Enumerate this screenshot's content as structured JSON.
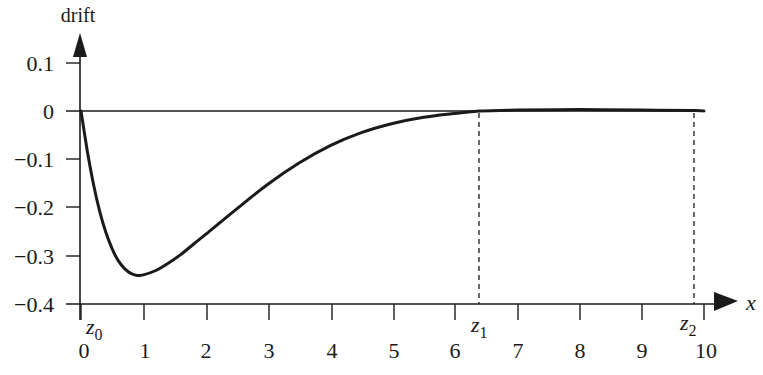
{
  "chart_data": {
    "type": "line",
    "title": "",
    "xlabel": "x",
    "ylabel": "drift",
    "xlim": [
      0,
      10
    ],
    "ylim": [
      -0.4,
      0.1
    ],
    "grid": false,
    "legend": null,
    "x_ticks": [
      0,
      1,
      2,
      3,
      4,
      5,
      6,
      7,
      8,
      9,
      10
    ],
    "x_tick_labels": [
      "0",
      "1",
      "2",
      "3",
      "4",
      "5",
      "6",
      "7",
      "8",
      "9",
      "10"
    ],
    "y_ticks": [
      0.1,
      0,
      -0.1,
      -0.2,
      -0.3,
      -0.4
    ],
    "y_tick_labels": [
      "0.1",
      "0",
      "−0.1",
      "−0.2",
      "−0.3",
      "−0.4"
    ],
    "series": [
      {
        "name": "drift",
        "x": [
          0,
          0.1,
          0.2,
          0.3,
          0.4,
          0.5,
          0.6,
          0.7,
          0.8,
          0.9,
          1.0,
          1.2,
          1.4,
          1.6,
          1.8,
          2.0,
          2.5,
          3.0,
          3.5,
          4.0,
          4.5,
          5.0,
          5.5,
          6.0,
          6.4,
          7.0,
          8.0,
          9.0,
          9.85,
          10.0
        ],
        "values": [
          0,
          -0.082,
          -0.152,
          -0.208,
          -0.252,
          -0.286,
          -0.311,
          -0.327,
          -0.337,
          -0.341,
          -0.34,
          -0.331,
          -0.316,
          -0.298,
          -0.277,
          -0.256,
          -0.203,
          -0.152,
          -0.108,
          -0.072,
          -0.045,
          -0.026,
          -0.013,
          -0.005,
          0.0,
          0.002,
          0.003,
          0.002,
          0.001,
          0.0
        ]
      }
    ],
    "annotations": [
      {
        "type": "vline",
        "x": 6.4,
        "style": "dashed",
        "label": "z1",
        "label_base": "z",
        "label_sub": "1"
      },
      {
        "type": "vline",
        "x": 9.85,
        "style": "dashed",
        "label": "z2",
        "label_base": "z",
        "label_sub": "2"
      },
      {
        "type": "point-label",
        "x": 0,
        "label": "z0",
        "label_base": "z",
        "label_sub": "0"
      },
      {
        "type": "hline",
        "y": 0,
        "style": "solid"
      }
    ]
  },
  "labels": {
    "ylabel": "drift",
    "xlabel": "x",
    "y_ticks": [
      "0.1",
      "0",
      "−0.1",
      "−0.2",
      "−0.3",
      "−0.4"
    ],
    "x_ticks": [
      "0",
      "1",
      "2",
      "3",
      "4",
      "5",
      "6",
      "7",
      "8",
      "9",
      "10"
    ],
    "z0_base": "z",
    "z0_sub": "0",
    "z1_base": "z",
    "z1_sub": "1",
    "z2_base": "z",
    "z2_sub": "2"
  }
}
